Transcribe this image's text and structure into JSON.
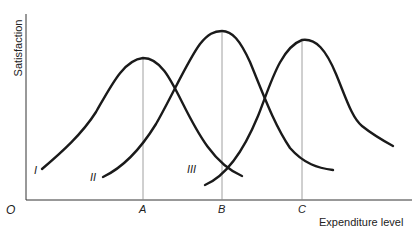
{
  "diagram": {
    "y_axis_label": "Satisfaction",
    "x_axis_label": "Expenditure level",
    "origin_label": "O",
    "x_ticks": [
      {
        "label": "A",
        "x": 143
      },
      {
        "label": "B",
        "x": 222
      },
      {
        "label": "C",
        "x": 302
      }
    ],
    "curves": [
      {
        "label": "I",
        "peak_at": "A"
      },
      {
        "label": "II",
        "peak_at": "B"
      },
      {
        "label": "III",
        "peak_at": "C"
      }
    ],
    "colors": {
      "curve": "#1a1a1a",
      "axis": "#333333",
      "guide": "#888888"
    }
  }
}
